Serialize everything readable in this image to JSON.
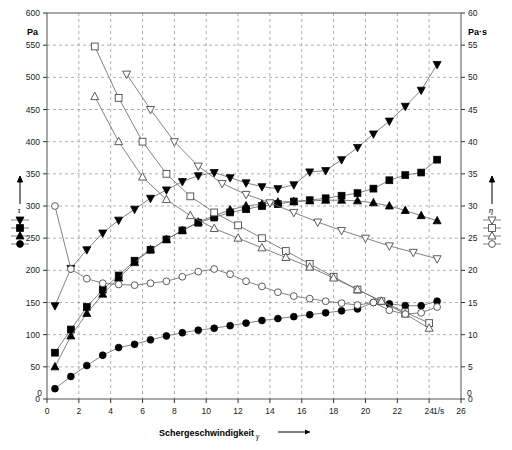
{
  "figure": {
    "left_unit": "Pa",
    "right_unit": "Pa·s",
    "x_unit": "1/s",
    "x_title": "Schergeschwindigkeit",
    "x_symbol": "γ",
    "tau_symbol": "τ",
    "eta_symbol": "η"
  },
  "chart_data": {
    "type": "line",
    "title": "",
    "subtitle": "",
    "xlabel": "Schergeschwindigkeit γ [1/s]",
    "ylabel": "τ [Pa]",
    "y2label": "η [Pa·s]",
    "xlim": [
      0,
      26
    ],
    "ylim": [
      0,
      600
    ],
    "y2lim": [
      0,
      60
    ],
    "grid": true,
    "legend_position": "outside-left-and-right",
    "x_ticks": [
      0,
      2,
      4,
      6,
      8,
      10,
      12,
      14,
      16,
      18,
      20,
      22,
      24,
      26
    ],
    "y_ticks": [
      0,
      50,
      100,
      150,
      200,
      250,
      300,
      350,
      400,
      450,
      500,
      550,
      600
    ],
    "y2_ticks": [
      0,
      5,
      10,
      15,
      20,
      25,
      30,
      35,
      40,
      45,
      50,
      55,
      60
    ],
    "legend_left": {
      "symbol": "τ",
      "axis": "left",
      "entries": [
        "filled-down-triangle",
        "filled-square",
        "filled-up-triangle",
        "filled-circle"
      ]
    },
    "legend_right": {
      "symbol": "η",
      "axis": "right",
      "entries": [
        "open-down-triangle",
        "open-square",
        "open-up-triangle",
        "open-circle"
      ]
    },
    "series": [
      {
        "name": "tau-down-triangle",
        "marker": "filled-down-triangle",
        "axis": "left",
        "unit": "Pa",
        "x": [
          0.5,
          1.5,
          2.5,
          3.5,
          4.5,
          5.5,
          6.5,
          7.5,
          8.5,
          9.5,
          10.5,
          11.5,
          12.5,
          13.5,
          14.5,
          15.5,
          16.5,
          17.5,
          18.5,
          19.5,
          20.5,
          21.5,
          22.5,
          23.5,
          24.5
        ],
        "values": [
          145,
          203,
          232,
          258,
          278,
          295,
          312,
          325,
          338,
          347,
          352,
          344,
          336,
          330,
          327,
          333,
          353,
          355,
          372,
          391,
          412,
          432,
          455,
          480,
          520
        ]
      },
      {
        "name": "tau-square",
        "marker": "filled-square",
        "axis": "left",
        "unit": "Pa",
        "x": [
          0.5,
          1.5,
          2.5,
          3.5,
          4.5,
          5.5,
          6.5,
          7.5,
          8.5,
          9.5,
          10.5,
          11.5,
          12.5,
          13.5,
          14.5,
          15.5,
          16.5,
          17.5,
          18.5,
          19.5,
          20.5,
          21.5,
          22.5,
          23.5,
          24.5
        ],
        "values": [
          72,
          108,
          143,
          170,
          192,
          215,
          232,
          248,
          262,
          274,
          282,
          290,
          295,
          300,
          303,
          307,
          309,
          312,
          316,
          320,
          327,
          340,
          348,
          352,
          372
        ]
      },
      {
        "name": "tau-up-triangle",
        "marker": "filled-up-triangle",
        "axis": "left",
        "unit": "Pa",
        "x": [
          0.5,
          1.5,
          2.5,
          3.5,
          4.5,
          5.5,
          6.5,
          7.5,
          8.5,
          9.5,
          10.5,
          11.5,
          12.5,
          13.5,
          14.5,
          15.5,
          16.5,
          17.5,
          18.5,
          19.5,
          20.5,
          21.5,
          22.5,
          23.5,
          24.5
        ],
        "values": [
          50,
          98,
          133,
          163,
          188,
          212,
          232,
          248,
          262,
          275,
          285,
          294,
          300,
          303,
          306,
          307,
          308,
          309,
          309,
          308,
          305,
          300,
          293,
          285,
          277
        ]
      },
      {
        "name": "tau-circle",
        "marker": "filled-circle",
        "axis": "left",
        "unit": "Pa",
        "x": [
          0.5,
          1.5,
          2.5,
          3.5,
          4.5,
          5.5,
          6.5,
          7.5,
          8.5,
          9.5,
          10.5,
          11.5,
          12.5,
          13.5,
          14.5,
          15.5,
          16.5,
          17.5,
          18.5,
          19.5,
          20.5,
          21.5,
          22.5,
          23.5,
          24.5
        ],
        "values": [
          16,
          35,
          52,
          68,
          80,
          85,
          92,
          98,
          103,
          107,
          110,
          114,
          118,
          122,
          125,
          128,
          131,
          134,
          137,
          140,
          150,
          148,
          145,
          145,
          152
        ]
      },
      {
        "name": "eta-square",
        "marker": "open-square",
        "axis": "right",
        "unit": "Pa·s",
        "x": [
          3,
          4.5,
          6,
          7.5,
          9,
          10.5,
          12,
          13.5,
          15,
          16.5,
          18,
          19.5,
          21,
          22.5,
          24
        ],
        "values": [
          54.8,
          46.8,
          40.0,
          35.0,
          31.5,
          29.0,
          27.0,
          25.0,
          23.0,
          21.0,
          19.0,
          17.0,
          15.2,
          13.5,
          11.8
        ]
      },
      {
        "name": "eta-up-triangle",
        "marker": "open-up-triangle",
        "axis": "right",
        "unit": "Pa·s",
        "x": [
          3,
          4.5,
          6,
          7.5,
          9,
          10.5,
          12,
          13.5,
          15,
          16.5,
          18,
          19.5,
          21,
          22.5,
          24
        ],
        "values": [
          47.0,
          40.0,
          34.5,
          31.0,
          28.5,
          26.5,
          25.0,
          23.5,
          22.0,
          20.5,
          18.8,
          17.0,
          15.2,
          13.2,
          11.0
        ]
      },
      {
        "name": "eta-down-triangle",
        "marker": "open-down-triangle",
        "axis": "right",
        "unit": "Pa·s",
        "x": [
          5,
          6.5,
          8,
          9.5,
          11,
          12.5,
          14,
          15.5,
          17,
          18.5,
          20,
          21.5,
          23,
          24.5
        ],
        "values": [
          50.5,
          45.0,
          40.0,
          36.2,
          33.5,
          31.8,
          30.5,
          29.0,
          27.5,
          26.2,
          25.0,
          23.8,
          22.8,
          21.8
        ]
      },
      {
        "name": "eta-circle",
        "marker": "open-circle",
        "axis": "right",
        "unit": "Pa·s",
        "x": [
          0.5,
          1.5,
          2.5,
          3.5,
          4.5,
          5.5,
          6.5,
          7.5,
          8.5,
          9.5,
          10.5,
          11.5,
          12.5,
          13.5,
          14.5,
          15.5,
          16.5,
          17.5,
          18.5,
          19.5,
          20.5,
          21.5,
          22.5,
          23.5,
          24.5
        ],
        "values": [
          30.0,
          20.2,
          18.7,
          18.0,
          17.8,
          17.7,
          18.0,
          18.3,
          19.0,
          19.8,
          20.2,
          19.4,
          18.3,
          17.5,
          16.6,
          16.0,
          15.6,
          15.2,
          14.9,
          14.6,
          15.0,
          13.8,
          13.2,
          13.4,
          14.3
        ]
      }
    ]
  }
}
